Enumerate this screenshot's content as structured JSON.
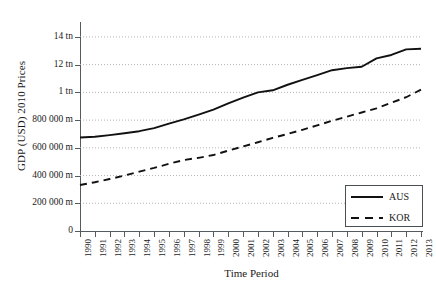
{
  "chart_data": {
    "type": "line",
    "title": "",
    "xlabel": "Time Period",
    "ylabel": "GDP (USD) 2010 Prices",
    "grid": true,
    "legend_position": "bottom-right",
    "xlim": [
      1990,
      2013
    ],
    "ylim": [
      0,
      1450000
    ],
    "x": [
      1990,
      1991,
      1992,
      1993,
      1994,
      1995,
      1996,
      1997,
      1998,
      1999,
      2000,
      2001,
      2002,
      2003,
      2004,
      2005,
      2006,
      2007,
      2008,
      2009,
      2010,
      2011,
      2012,
      2013
    ],
    "xticklabels": [
      "1990",
      "1991",
      "1992",
      "1993",
      "1994",
      "1995",
      "1996",
      "1997",
      "1998",
      "1999",
      "2000",
      "2001",
      "2002",
      "2003",
      "2004",
      "2005",
      "2006",
      "2007",
      "2008",
      "2009",
      "2010",
      "2011",
      "2012",
      "2013"
    ],
    "yticks": [
      0,
      200000,
      400000,
      600000,
      800000,
      1000000,
      1200000,
      1400000
    ],
    "yticklabels": [
      "0",
      "200 000 m",
      "400 000 m",
      "600 000 m",
      "800 000 m",
      "1 tn",
      "12 tn",
      "14 tn"
    ],
    "series": [
      {
        "name": "AUS",
        "style": "solid",
        "color": "#111111",
        "values": [
          675000,
          680000,
          692000,
          705000,
          720000,
          742000,
          775000,
          805000,
          840000,
          875000,
          920000,
          962000,
          1000000,
          1015000,
          1055000,
          1090000,
          1125000,
          1160000,
          1175000,
          1185000,
          1245000,
          1270000,
          1310000,
          1315000
        ]
      },
      {
        "name": "KOR",
        "style": "dashed",
        "color": "#111111",
        "values": [
          332000,
          352000,
          375000,
          400000,
          428000,
          455000,
          485000,
          512000,
          528000,
          548000,
          580000,
          610000,
          640000,
          672000,
          700000,
          730000,
          762000,
          795000,
          825000,
          855000,
          885000,
          925000,
          965000,
          1020000
        ]
      }
    ]
  },
  "legend": {
    "entries": [
      {
        "label": "AUS",
        "style": "solid"
      },
      {
        "label": "KOR",
        "style": "dashed"
      }
    ]
  },
  "colors": {
    "line": "#111111",
    "axis": "#555a5e",
    "grid": "#b9b2b6",
    "text": "#1a1a1a",
    "background": "#ffffff"
  }
}
